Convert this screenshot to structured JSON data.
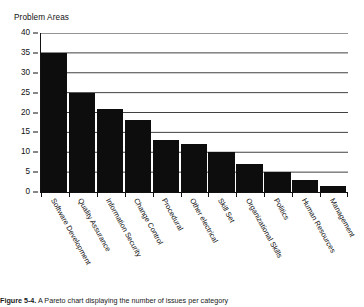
{
  "chart_data": {
    "type": "bar",
    "title": "Problem Areas",
    "xlabel": "",
    "ylabel": "",
    "ylim": [
      0,
      40
    ],
    "ytick_step": 5,
    "yticks": [
      0,
      5,
      10,
      15,
      20,
      25,
      30,
      35,
      40
    ],
    "grid": "horizontal",
    "legend": "none",
    "bar_color": "#0d0d0d",
    "categories": [
      "Software Development",
      "Quality Assurance",
      "Information Security",
      "Change Control",
      "Procedural",
      "Other electrical",
      "Skill Set",
      "Organizational Skills",
      "Politics",
      "Human Resources",
      "Management"
    ],
    "values": [
      35,
      25,
      21,
      18,
      13,
      12,
      10,
      7,
      5,
      3,
      1.5
    ]
  },
  "caption": {
    "label": "Figure 5-4.",
    "text": "A Pareto chart displaying the number of issues per category"
  }
}
